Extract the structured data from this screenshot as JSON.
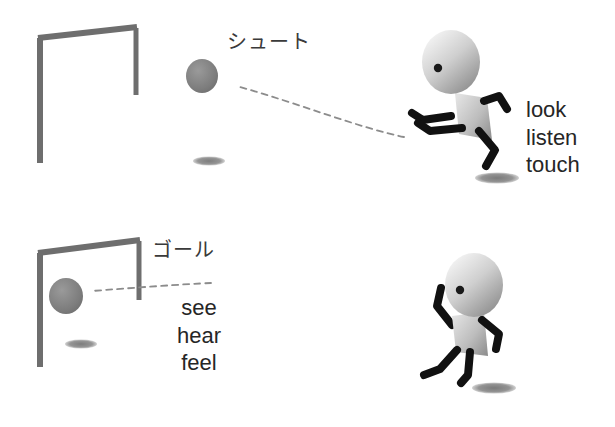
{
  "figure": {
    "background_color": "#ffffff",
    "panels": [
      {
        "id": "top",
        "action_label": "シュート",
        "senses": [
          "look",
          "listen",
          "touch"
        ],
        "senses_text": "look\nlisten\ntouch",
        "ball_state": "in flight toward goal",
        "player_pose": "kicking / running"
      },
      {
        "id": "bottom",
        "action_label": "ゴール",
        "senses": [
          "see",
          "hear",
          "feel"
        ],
        "senses_text": "see\nhear\nfeel",
        "ball_state": "inside the goal",
        "player_pose": "celebrating with raised arm"
      }
    ]
  },
  "colors": {
    "background": "#ffffff",
    "goal_frame": "#6e6e6e",
    "ball": "#7d7d7d",
    "shadow": "#7a7a7a",
    "limb": "#111111",
    "body_light": "#dcdcdc",
    "body_dark": "#8f8f8f",
    "head_light": "#e8e8e8",
    "head_dark": "#8a8a8a",
    "trajectory": "#8c8c8c",
    "text": "#262626",
    "jp_text": "#3a3a3a"
  },
  "labels": {
    "shoot_jp": "シュート",
    "goal_jp": "ゴール",
    "look": "look",
    "listen": "listen",
    "touch": "touch",
    "see": "see",
    "hear": "hear",
    "feel": "feel",
    "senses_top": "look\nlisten\ntouch",
    "senses_bottom": "see\nhear\nfeel"
  }
}
